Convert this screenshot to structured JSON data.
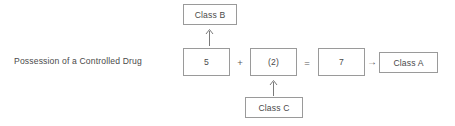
{
  "diagram": {
    "title_label": "Possession of a Controlled Drug",
    "equation": {
      "term_1": "5",
      "operator_plus": "+",
      "term_2": "(2)",
      "operator_equals": "=",
      "total": "7",
      "operator_arrow": "→",
      "result": "Class A"
    },
    "annotations": {
      "top": "Class B",
      "bottom": "Class C"
    },
    "colors": {
      "box_border": "#9a9a9a",
      "text": "#4a4a4a",
      "background": "#ffffff"
    }
  }
}
